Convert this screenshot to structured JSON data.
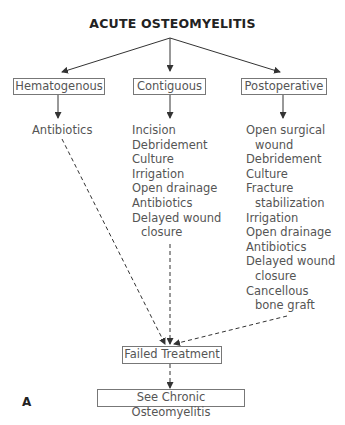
{
  "diagram": {
    "title": "ACUTE OSTEOMYELITIS",
    "categories": [
      {
        "label": "Hematogenous",
        "treatments": [
          "Antibiotics"
        ]
      },
      {
        "label": "Contiguous",
        "treatments": [
          "Incision",
          "Debridement",
          "Culture",
          "Irrigation",
          "Open drainage",
          "Antibiotics",
          "Delayed wound",
          "closure"
        ]
      },
      {
        "label": "Postoperative",
        "treatments": [
          "Open surgical",
          "wound",
          "Debridement",
          "Culture",
          "Fracture",
          "stabilization",
          "Irrigation",
          "Open drainage",
          "Antibiotics",
          "Delayed wound",
          "closure",
          "Cancellous",
          "bone graft"
        ]
      }
    ],
    "failed_node": "Failed Treatment",
    "final_node": "See Chronic Osteomyelitis",
    "panel_label": "A",
    "edges": [
      {
        "from": "ACUTE OSTEOMYELITIS",
        "to": "Hematogenous",
        "style": "solid"
      },
      {
        "from": "ACUTE OSTEOMYELITIS",
        "to": "Contiguous",
        "style": "solid"
      },
      {
        "from": "ACUTE OSTEOMYELITIS",
        "to": "Postoperative",
        "style": "solid"
      },
      {
        "from": "Hematogenous",
        "to": "Antibiotics",
        "style": "solid"
      },
      {
        "from": "Contiguous",
        "to": "Incision…",
        "style": "solid"
      },
      {
        "from": "Postoperative",
        "to": "Open surgical wound…",
        "style": "solid"
      },
      {
        "from": "Antibiotics",
        "to": "Failed Treatment",
        "style": "dashed"
      },
      {
        "from": "Contiguous treatments",
        "to": "Failed Treatment",
        "style": "dashed"
      },
      {
        "from": "Postoperative treatments",
        "to": "Failed Treatment",
        "style": "dashed"
      },
      {
        "from": "Failed Treatment",
        "to": "See Chronic Osteomyelitis",
        "style": "dashed"
      }
    ]
  }
}
